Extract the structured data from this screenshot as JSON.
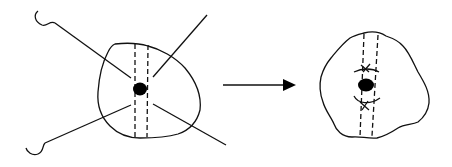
{
  "diagram": {
    "description": "Surgical wound closure schematic: left shows a wound with a central tumor/lesion, dashed incision lines and four traction sutures/hooks pulling outward; arrow indicates transformation; right shows the closed tissue with two sutured arcs above and below the central lesion.",
    "colors": {
      "stroke": "#111111",
      "fill": "#000000",
      "background": "#ffffff"
    },
    "left_figure": {
      "label": "before",
      "elements": [
        "irregular-tissue-outline",
        "two-dashed-vertical-lines",
        "central-dot",
        "four-radiating-lines",
        "two-hooks"
      ]
    },
    "arrow": {
      "label": "transforms-to"
    },
    "right_figure": {
      "label": "after",
      "elements": [
        "irregular-tissue-outline",
        "two-dashed-vertical-lines",
        "central-dot",
        "upper-arc-with-cross",
        "lower-arc-with-cross"
      ]
    }
  }
}
